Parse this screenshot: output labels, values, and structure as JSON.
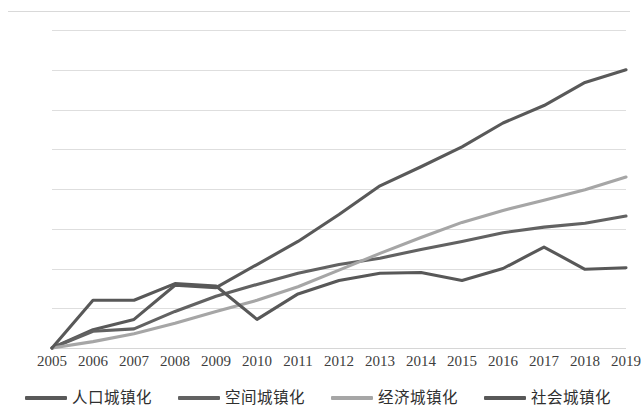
{
  "chart_data": {
    "type": "line",
    "title": "",
    "xlabel": "",
    "ylabel": "",
    "categories": [
      2005,
      2006,
      2007,
      2008,
      2009,
      2010,
      2011,
      2012,
      2013,
      2014,
      2015,
      2016,
      2017,
      2018,
      2019
    ],
    "ylim": [
      0,
      0.4
    ],
    "xlim": [
      2005,
      2019
    ],
    "ytick_labels": [
      "0",
      "0.05",
      "0.1",
      "0.15",
      "0.2",
      "0.25",
      "0.3",
      "0.35",
      "0.4"
    ],
    "ytick_values": [
      0,
      0.05,
      0.1,
      0.15,
      0.2,
      0.25,
      0.3,
      0.35,
      0.4
    ],
    "xtick_labels": [
      "2005",
      "2006",
      "2007",
      "2008",
      "2009",
      "2010",
      "2011",
      "2012",
      "2013",
      "2014",
      "2015",
      "2016",
      "2017",
      "2018",
      "2019"
    ],
    "grid": "horizontal",
    "legend_position": "bottom",
    "series": [
      {
        "name": "人口城镇化",
        "color": "#595959",
        "values": [
          0.0,
          0.023,
          0.036,
          0.079,
          0.076,
          0.105,
          0.134,
          0.168,
          0.204,
          0.228,
          0.253,
          0.283,
          0.305,
          0.334,
          0.35
        ]
      },
      {
        "name": "空间城镇化",
        "color": "#626262",
        "values": [
          0.0,
          0.021,
          0.024,
          0.046,
          0.065,
          0.08,
          0.094,
          0.105,
          0.113,
          0.124,
          0.134,
          0.145,
          0.152,
          0.157,
          0.166
        ]
      },
      {
        "name": "经济城镇化",
        "color": "#a6a6a6",
        "values": [
          0.0,
          0.008,
          0.018,
          0.031,
          0.046,
          0.06,
          0.077,
          0.098,
          0.119,
          0.139,
          0.158,
          0.173,
          0.186,
          0.199,
          0.215
        ]
      },
      {
        "name": "社会城镇化",
        "color": "#585858",
        "values": [
          0.0,
          0.06,
          0.06,
          0.081,
          0.078,
          0.036,
          0.068,
          0.085,
          0.094,
          0.095,
          0.085,
          0.1,
          0.127,
          0.099,
          0.101
        ]
      }
    ]
  },
  "legend": {
    "items": [
      {
        "label": "人口城镇化",
        "swatch_name": "legend-swatch-population"
      },
      {
        "label": "空间城镇化",
        "swatch_name": "legend-swatch-spatial"
      },
      {
        "label": "经济城镇化",
        "swatch_name": "legend-swatch-economic"
      },
      {
        "label": "社会城镇化",
        "swatch_name": "legend-swatch-social"
      }
    ]
  },
  "colors": {
    "grid": "#dedede",
    "text": "#3d3d3d",
    "background": "#ffffff"
  }
}
